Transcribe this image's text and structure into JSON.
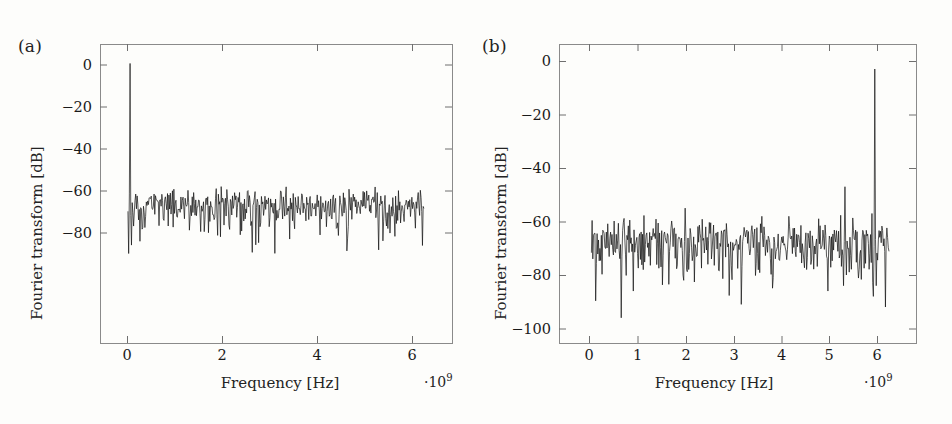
{
  "figure": {
    "background": "#fdfdfb",
    "ink": "#1a1a1a",
    "panels": [
      {
        "id": "a",
        "label": "(a)",
        "xlabel": "Frequency [Hz]",
        "ylabel": "Fourier transform [dB]",
        "x_exponent_label": "·10",
        "x_exponent_sup": "9",
        "xticks": [
          "0",
          "2",
          "4",
          "6"
        ],
        "xtick_values": [
          0,
          2,
          4,
          6
        ],
        "yticks": [
          "0",
          "−20",
          "−40",
          "−60",
          "−80"
        ],
        "ytick_values": [
          0,
          -20,
          -40,
          -60,
          -80
        ]
      },
      {
        "id": "b",
        "label": "(b)",
        "xlabel": "Frequency [Hz]",
        "ylabel": "Fourier transform [dB]",
        "x_exponent_label": "·10",
        "x_exponent_sup": "9",
        "xticks": [
          "0",
          "1",
          "2",
          "3",
          "4",
          "5",
          "6"
        ],
        "xtick_values": [
          0,
          1,
          2,
          3,
          4,
          5,
          6
        ],
        "yticks": [
          "0",
          "−20",
          "−40",
          "−60",
          "−80",
          "−100"
        ],
        "ytick_values": [
          0,
          -20,
          -40,
          -60,
          -80,
          -100
        ]
      }
    ]
  },
  "chart_data": [
    {
      "type": "line",
      "panel": "a",
      "title": "",
      "xlabel": "Frequency [Hz]",
      "ylabel": "Fourier transform [dB]",
      "x_unit_multiplier": 1000000000.0,
      "xlim": [
        -0.35,
        6.75
      ],
      "ylim": [
        -98,
        8
      ],
      "grid": false,
      "legend": null,
      "line_color": "#101010",
      "line_width": 0.7,
      "data_x_range": [
        0.02,
        6.25
      ],
      "n_points": 420,
      "noise_floor_db": -66,
      "noise_spread_db": 11,
      "noise_min_db": -90,
      "noise_max_db": -55,
      "peaks": [
        {
          "frequency": 0.06,
          "amplitude_db": 0.5,
          "null_db": -90,
          "width": 0.035
        }
      ],
      "description": "Flat noise floor near -66 dB spanning 0 to 6.25e9 Hz with a single sharp carrier spike reaching 0 dB near 0.06e9 Hz."
    },
    {
      "type": "line",
      "panel": "b",
      "title": "",
      "xlabel": "Frequency [Hz]",
      "ylabel": "Fourier transform [dB]",
      "x_unit_multiplier": 1000000000.0,
      "xlim": [
        -0.35,
        6.75
      ],
      "ylim": [
        -108,
        8
      ],
      "grid": false,
      "legend": null,
      "line_color": "#101010",
      "line_width": 0.7,
      "data_x_range": [
        0.05,
        6.25
      ],
      "n_points": 420,
      "noise_floor_db": -66,
      "noise_spread_db": 11,
      "noise_min_db": -96,
      "noise_max_db": -54,
      "peaks": [
        {
          "frequency": 5.95,
          "amplitude_db": -3,
          "null_db": -88,
          "width": 0.04
        },
        {
          "frequency": 5.33,
          "amplitude_db": -47,
          "null_db": -84,
          "width": 0.03
        },
        {
          "frequency": 2.0,
          "amplitude_db": -55,
          "null_db": -82,
          "width": 0.025
        }
      ],
      "notable_dips": [
        {
          "frequency": 0.67,
          "amplitude_db": -96
        },
        {
          "frequency": 0.92,
          "amplitude_db": -86
        },
        {
          "frequency": 4.98,
          "amplitude_db": -86
        }
      ],
      "description": "Flat noise floor near -66 dB spanning 0 to 6.25e9 Hz with a strong spike reaching -3 dB near 5.95e9 Hz and a smaller spike near 5.33e9 Hz."
    }
  ]
}
